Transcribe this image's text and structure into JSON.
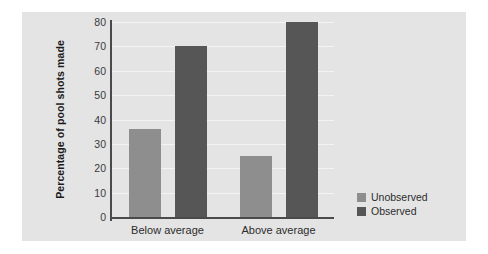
{
  "chart_data": {
    "type": "bar",
    "title": "",
    "subtitle": "",
    "xlabel": "",
    "ylabel": "Percentage of pool shots made",
    "categories": [
      "Below average",
      "Above average"
    ],
    "series": [
      {
        "name": "Unobserved",
        "values": [
          36,
          25
        ],
        "color": "#8e8e8e"
      },
      {
        "name": "Observed",
        "values": [
          70,
          80
        ],
        "color": "#565656"
      }
    ],
    "series_layout_note": "grouped",
    "ylim": [
      0,
      80
    ],
    "ytick_values": [
      0,
      10,
      20,
      30,
      40,
      50,
      60,
      70,
      80
    ],
    "ytick_labels": [
      "0",
      "10",
      "20",
      "30",
      "40",
      "50",
      "60",
      "70",
      "80"
    ],
    "grid": true,
    "grid_color": "#f4f4f4",
    "legend_position": "right-bottom",
    "legend_entries": [
      "Unobserved",
      "Observed"
    ],
    "panel_background": "#e4e4e4",
    "page_background": "#ffffff",
    "axis_color": "#4a4a4a",
    "bars": [
      {
        "category": "Below average",
        "series": "Unobserved",
        "value": 36
      },
      {
        "category": "Below average",
        "series": "Observed",
        "value": 25
      },
      {
        "category": "Above average",
        "series": "Unobserved",
        "value": 70
      },
      {
        "category": "Above average",
        "series": "Observed",
        "value": 80
      }
    ]
  }
}
